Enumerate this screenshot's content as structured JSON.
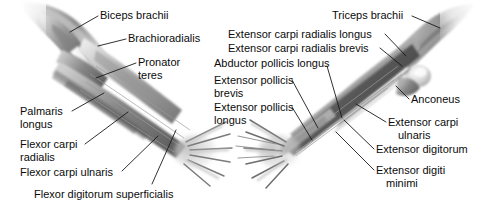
{
  "figure": {
    "background_color": "#ffffff",
    "text_color": "#0b0b0b",
    "leader_line_color": "#1a1a1a",
    "views": [
      {
        "name": "anterior-forearm-view",
        "description": "Anterior (flexor) view of right forearm, elbow upper-left, hand lower-right"
      },
      {
        "name": "posterior-forearm-view",
        "description": "Posterior (extensor) view of right forearm, elbow upper-right, hand lower-left"
      }
    ]
  },
  "labels": {
    "left_view": [
      {
        "id": "biceps-brachii",
        "text": "Biceps brachii",
        "x": 100,
        "y": 9,
        "align": "left"
      },
      {
        "id": "brachioradialis",
        "text": "Brachioradialis",
        "x": 128,
        "y": 32,
        "align": "left"
      },
      {
        "id": "pronator-teres-line1",
        "text": "Pronator",
        "x": 138,
        "y": 56,
        "align": "left"
      },
      {
        "id": "pronator-teres-line2",
        "text": "teres",
        "x": 138,
        "y": 69,
        "align": "left"
      },
      {
        "id": "palmaris-longus-line1",
        "text": "Palmaris",
        "x": 20,
        "y": 105,
        "align": "left"
      },
      {
        "id": "palmaris-longus-line2",
        "text": "longus",
        "x": 20,
        "y": 118,
        "align": "left"
      },
      {
        "id": "flexor-carpi-radialis-line1",
        "text": "Flexor carpi",
        "x": 20,
        "y": 138,
        "align": "left"
      },
      {
        "id": "flexor-carpi-radialis-line2",
        "text": "radialis",
        "x": 20,
        "y": 151,
        "align": "left"
      },
      {
        "id": "flexor-carpi-ulnaris",
        "text": "Flexor carpi ulnaris",
        "x": 20,
        "y": 166,
        "align": "left"
      },
      {
        "id": "flexor-digitorum-superficialis",
        "text": "Flexor digitorum superficialis",
        "x": 34,
        "y": 188,
        "align": "left"
      }
    ],
    "right_view": [
      {
        "id": "triceps-brachii",
        "text": "Triceps brachii",
        "x": 332,
        "y": 9,
        "align": "left"
      },
      {
        "id": "extensor-carpi-radialis-longus",
        "text": "Extensor carpi radialis longus",
        "x": 228,
        "y": 28,
        "align": "left"
      },
      {
        "id": "extensor-carpi-radialis-brevis",
        "text": "Extensor carpi radialis brevis",
        "x": 228,
        "y": 42,
        "align": "left"
      },
      {
        "id": "abductor-pollicis-longus",
        "text": "Abductor pollicis longus",
        "x": 214,
        "y": 57,
        "align": "left"
      },
      {
        "id": "extensor-pollicis-brevis-line1",
        "text": "Extensor pollicis",
        "x": 214,
        "y": 74,
        "align": "left"
      },
      {
        "id": "extensor-pollicis-brevis-line2",
        "text": "brevis",
        "x": 214,
        "y": 87,
        "align": "left"
      },
      {
        "id": "extensor-pollicis-longus-line1",
        "text": "Extensor pollicis",
        "x": 214,
        "y": 101,
        "align": "left"
      },
      {
        "id": "extensor-pollicis-longus-line2",
        "text": "longus",
        "x": 214,
        "y": 114,
        "align": "left"
      },
      {
        "id": "anconeus",
        "text": "Anconeus",
        "x": 411,
        "y": 93,
        "align": "left"
      },
      {
        "id": "extensor-carpi-ulnaris-line1",
        "text": "Extensor carpi",
        "x": 388,
        "y": 116,
        "align": "left"
      },
      {
        "id": "extensor-carpi-ulnaris-line2",
        "text": "ulnaris",
        "x": 398,
        "y": 129,
        "align": "left"
      },
      {
        "id": "extensor-digitorum",
        "text": "Extensor digitorum",
        "x": 376,
        "y": 143,
        "align": "left"
      },
      {
        "id": "extensor-digiti-minimi-line1",
        "text": "Extensor digiti",
        "x": 376,
        "y": 164,
        "align": "left"
      },
      {
        "id": "extensor-digiti-minimi-line2",
        "text": "minimi",
        "x": 386,
        "y": 177,
        "align": "left"
      }
    ]
  }
}
